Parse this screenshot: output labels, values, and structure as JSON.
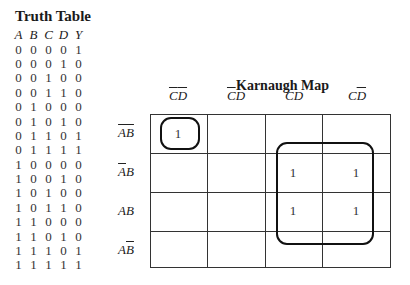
{
  "truth_table": {
    "title": "Truth Table",
    "headers": [
      "A",
      "B",
      "C",
      "D",
      "Y"
    ],
    "rows": [
      [
        "0",
        "0",
        "0",
        "0",
        "1"
      ],
      [
        "0",
        "0",
        "0",
        "1",
        "0"
      ],
      [
        "0",
        "0",
        "1",
        "0",
        "0"
      ],
      [
        "0",
        "0",
        "1",
        "1",
        "0"
      ],
      [
        "0",
        "1",
        "0",
        "0",
        "0"
      ],
      [
        "0",
        "1",
        "0",
        "1",
        "0"
      ],
      [
        "0",
        "1",
        "1",
        "0",
        "1"
      ],
      [
        "0",
        "1",
        "1",
        "1",
        "1"
      ],
      [
        "1",
        "0",
        "0",
        "0",
        "0"
      ],
      [
        "1",
        "0",
        "0",
        "1",
        "0"
      ],
      [
        "1",
        "0",
        "1",
        "0",
        "0"
      ],
      [
        "1",
        "0",
        "1",
        "1",
        "0"
      ],
      [
        "1",
        "1",
        "0",
        "0",
        "0"
      ],
      [
        "1",
        "1",
        "0",
        "1",
        "0"
      ],
      [
        "1",
        "1",
        "1",
        "0",
        "1"
      ],
      [
        "1",
        "1",
        "1",
        "1",
        "1"
      ]
    ]
  },
  "karnaugh_map": {
    "title": "Karnaugh Map",
    "columns": [
      {
        "label": "C̄D̄",
        "c": "C",
        "c_bar": true,
        "d": "D",
        "d_bar": true
      },
      {
        "label": "C̄D",
        "c": "C",
        "c_bar": true,
        "d": "D",
        "d_bar": false
      },
      {
        "label": "CD",
        "c": "C",
        "c_bar": false,
        "d": "D",
        "d_bar": false
      },
      {
        "label": "CD̄",
        "c": "C",
        "c_bar": false,
        "d": "D",
        "d_bar": true
      }
    ],
    "rows": [
      {
        "label": "ĀB̄",
        "a": "A",
        "a_bar": true,
        "b": "B",
        "b_bar": true,
        "cells": [
          "1",
          "",
          "",
          ""
        ]
      },
      {
        "label": "ĀB",
        "a": "A",
        "a_bar": true,
        "b": "B",
        "b_bar": false,
        "cells": [
          "",
          "",
          "1",
          "1"
        ]
      },
      {
        "label": "AB",
        "a": "A",
        "a_bar": false,
        "b": "B",
        "b_bar": false,
        "cells": [
          "",
          "",
          "1",
          "1"
        ]
      },
      {
        "label": "AB̄",
        "a": "A",
        "a_bar": false,
        "b": "B",
        "b_bar": true,
        "cells": [
          "",
          "",
          "",
          ""
        ]
      }
    ],
    "groups": [
      {
        "name": "single-minterm-ABCD-bar",
        "cells": [
          [
            0,
            0
          ]
        ]
      },
      {
        "name": "quad-BC",
        "cells": [
          [
            1,
            2
          ],
          [
            1,
            3
          ],
          [
            2,
            2
          ],
          [
            2,
            3
          ]
        ]
      }
    ]
  }
}
